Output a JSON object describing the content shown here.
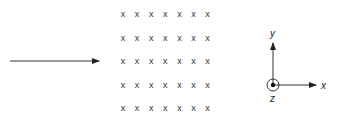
{
  "diagram": {
    "velocity_arrow": {
      "direction": "right"
    },
    "field_region": {
      "symbol": "x",
      "rows": 5,
      "cols": 7,
      "meaning": "field into page"
    },
    "axes": {
      "x_label": "x",
      "y_label": "y",
      "z_label": "z",
      "z_symbol": "dot-in-circle (out of page)"
    },
    "colors": {
      "ink": "#222222",
      "background": "#ffffff"
    }
  }
}
